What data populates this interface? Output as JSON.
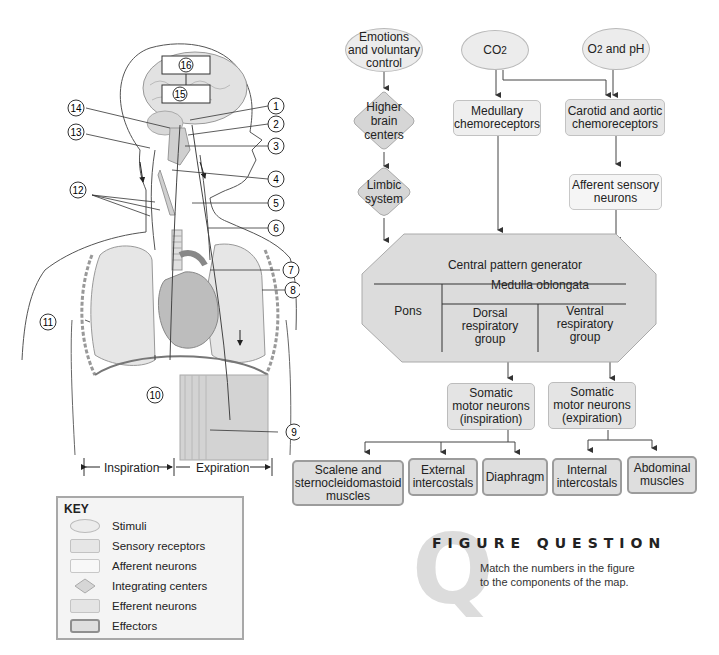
{
  "figure": {
    "body_labels": [
      "1",
      "2",
      "3",
      "4",
      "5",
      "6",
      "7",
      "8",
      "9",
      "10",
      "11",
      "12",
      "13",
      "14",
      "15",
      "16"
    ],
    "phase_labels": {
      "inspiration": "Inspiration",
      "expiration": "Expiration"
    }
  },
  "flowchart": {
    "stimuli": {
      "emotions": [
        "Emotions",
        "and voluntary",
        "control"
      ],
      "co2": "CO",
      "co2_sub": "2",
      "o2_ph_prefix": "O",
      "o2_ph_sub": "2",
      "o2_ph_suffix": " and pH"
    },
    "integrating": {
      "higher_brain": [
        "Higher",
        "brain",
        "centers"
      ],
      "limbic": [
        "Limbic",
        "system"
      ]
    },
    "sensory": {
      "medullary": [
        "Medullary",
        "chemoreceptors"
      ],
      "carotid": [
        "Carotid and aortic",
        "chemoreceptors"
      ]
    },
    "afferent": {
      "sensory_neurons": [
        "Afferent sensory",
        "neurons"
      ]
    },
    "cpg": {
      "title": "Central pattern generator",
      "pons": "Pons",
      "medulla": "Medulla oblongata",
      "dorsal": [
        "Dorsal",
        "respiratory",
        "group"
      ],
      "ventral": [
        "Ventral",
        "respiratory",
        "group"
      ]
    },
    "efferent": {
      "inspiration": [
        "Somatic",
        "motor neurons",
        "(inspiration)"
      ],
      "expiration": [
        "Somatic",
        "motor neurons",
        "(expiration)"
      ]
    },
    "effectors": {
      "scalene": [
        "Scalene and",
        "sternocleidomastoid",
        "muscles"
      ],
      "external": [
        "External",
        "intercostals"
      ],
      "diaphragm": "Diaphragm",
      "internal": [
        "Internal",
        "intercostals"
      ],
      "abdominal": [
        "Abdominal",
        "muscles"
      ]
    }
  },
  "key": {
    "title": "KEY",
    "items": [
      {
        "label": "Stimuli",
        "shape": "ellipse"
      },
      {
        "label": "Sensory receptors",
        "shape": "rect"
      },
      {
        "label": "Afferent neurons",
        "shape": "rect-light"
      },
      {
        "label": "Integrating centers",
        "shape": "diamond"
      },
      {
        "label": "Efferent neurons",
        "shape": "rect"
      },
      {
        "label": "Effectors",
        "shape": "rect-bold"
      }
    ]
  },
  "figure_question": {
    "letter": "Q",
    "title": "FIGURE QUESTION",
    "text": [
      "Match the numbers in the figure",
      "to the components of the map."
    ]
  },
  "colors": {
    "stimuli": "#ececec",
    "sensory": "#efefef",
    "afferent": "#f5f5f5",
    "integrating": "#d6d6d6",
    "efferent": "#e4e4e4",
    "effectors": "#dedede",
    "cpg": "#dcdcdc",
    "line": "#444444"
  }
}
